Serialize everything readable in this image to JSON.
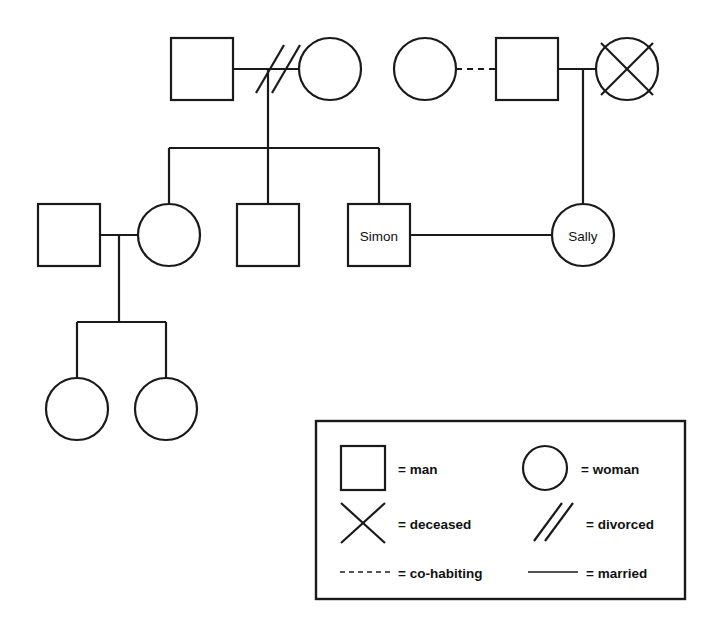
{
  "diagram": {
    "type": "genogram",
    "title": "",
    "canvas": {
      "width": 702,
      "height": 633
    },
    "background_color": "#ffffff",
    "line_color": "#1a1a1a",
    "people": [
      {
        "id": "g1-father-left",
        "shape": "square",
        "sex": "man",
        "label": "",
        "cx": 202,
        "cy": 69,
        "deceased": false
      },
      {
        "id": "g1-mother-left",
        "shape": "circle",
        "sex": "woman",
        "label": "",
        "cx": 330,
        "cy": 69,
        "deceased": false
      },
      {
        "id": "g1-woman-right",
        "shape": "circle",
        "sex": "woman",
        "label": "",
        "cx": 425,
        "cy": 69,
        "deceased": false
      },
      {
        "id": "g1-man-right",
        "shape": "square",
        "sex": "man",
        "label": "",
        "cx": 527,
        "cy": 69,
        "deceased": false
      },
      {
        "id": "g1-deceased-woman",
        "shape": "circle",
        "sex": "woman",
        "label": "",
        "cx": 627,
        "cy": 69,
        "deceased": true
      },
      {
        "id": "g2-husband",
        "shape": "square",
        "sex": "man",
        "label": "",
        "cx": 69,
        "cy": 235,
        "deceased": false
      },
      {
        "id": "g2-daughter",
        "shape": "circle",
        "sex": "woman",
        "label": "",
        "cx": 169,
        "cy": 235,
        "deceased": false
      },
      {
        "id": "g2-son-middle",
        "shape": "square",
        "sex": "man",
        "label": "",
        "cx": 268,
        "cy": 235,
        "deceased": false
      },
      {
        "id": "g2-simon",
        "shape": "square",
        "sex": "man",
        "label": "Simon",
        "cx": 379,
        "cy": 235,
        "deceased": false
      },
      {
        "id": "g2-sally",
        "shape": "circle",
        "sex": "woman",
        "label": "Sally",
        "cx": 583,
        "cy": 235,
        "deceased": false
      },
      {
        "id": "g3-daughter-1",
        "shape": "circle",
        "sex": "woman",
        "label": "",
        "cx": 77,
        "cy": 408,
        "deceased": false
      },
      {
        "id": "g3-daughter-2",
        "shape": "circle",
        "sex": "woman",
        "label": "",
        "cx": 166,
        "cy": 408,
        "deceased": false
      }
    ],
    "relationships": [
      {
        "from": "g1-father-left",
        "to": "g1-mother-left",
        "kind": "divorced"
      },
      {
        "from": "g1-woman-right",
        "to": "g1-man-right",
        "kind": "co-habiting"
      },
      {
        "from": "g1-man-right",
        "to": "g1-deceased-woman",
        "kind": "married"
      },
      {
        "from": "g2-husband",
        "to": "g2-daughter",
        "kind": "married"
      },
      {
        "from": "g2-simon",
        "to": "g2-sally",
        "kind": "married"
      }
    ],
    "children_links": [
      {
        "parents": "g1-father-left + g1-mother-left",
        "children": [
          "g2-daughter",
          "g2-son-middle",
          "g2-simon"
        ]
      },
      {
        "parents": "g1-man-right + g1-deceased-woman",
        "children": [
          "g2-sally"
        ]
      },
      {
        "parents": "g2-husband + g2-daughter",
        "children": [
          "g3-daughter-1",
          "g3-daughter-2"
        ]
      }
    ]
  },
  "legend": {
    "border_color": "#1a1a1a",
    "items": [
      {
        "key": "man",
        "symbol": "square-icon",
        "text": "= man"
      },
      {
        "key": "woman",
        "symbol": "circle-icon",
        "text": "= woman"
      },
      {
        "key": "deceased",
        "symbol": "cross-icon",
        "text": "= deceased"
      },
      {
        "key": "divorced",
        "symbol": "double-slash-icon",
        "text": "= divorced"
      },
      {
        "key": "co-habiting",
        "symbol": "dashed-line-icon",
        "text": "= co-habiting"
      },
      {
        "key": "married",
        "symbol": "solid-line-icon",
        "text": "= married"
      }
    ]
  }
}
